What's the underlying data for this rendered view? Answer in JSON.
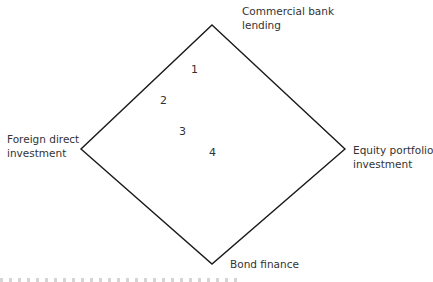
{
  "diagram": {
    "type": "diamond",
    "stroke_color": "#1a1a1a",
    "vertices": {
      "top": [
        212,
        25
      ],
      "right": [
        345,
        149
      ],
      "bottom": [
        212,
        264
      ],
      "left": [
        81,
        149
      ]
    },
    "corner_labels": {
      "top": [
        "Commercial bank",
        "lending"
      ],
      "left": [
        "Foreign direct",
        "investment"
      ],
      "right": [
        "Equity portfolio",
        "investment"
      ],
      "bottom": [
        "Bond finance"
      ]
    },
    "points": [
      {
        "label": "1"
      },
      {
        "label": "2"
      },
      {
        "label": "3"
      },
      {
        "label": "4"
      }
    ]
  }
}
